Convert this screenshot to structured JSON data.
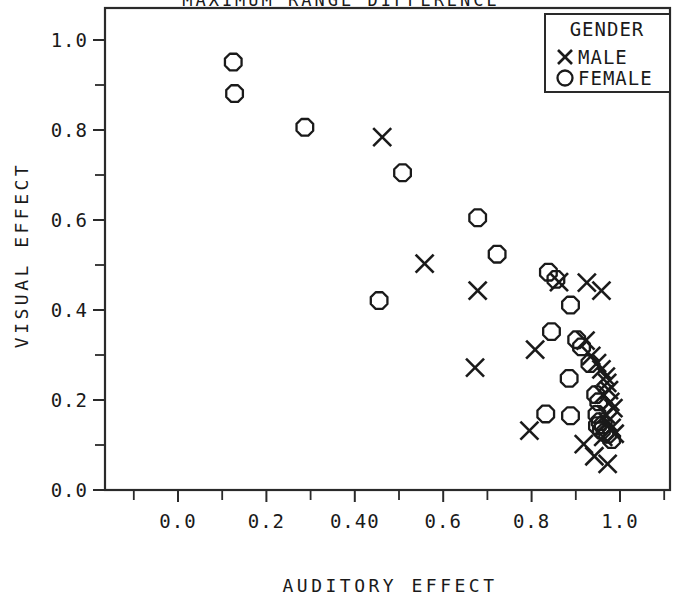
{
  "chart_data": {
    "type": "scatter",
    "title": "MAXIMUM RANGE DIFFERENCE",
    "xlabel": "AUDITORY EFFECT",
    "ylabel": "VISUAL EFFECT",
    "xlim": [
      -0.12,
      1.12
    ],
    "ylim": [
      -0.09,
      1.11
    ],
    "xticks": [
      0.0,
      0.2,
      0.4,
      0.6,
      0.8,
      1.0
    ],
    "xticklabels": [
      "0.0",
      "0.2",
      "0.40",
      "0.6",
      "0.8",
      "1.0"
    ],
    "yticks": [
      0.0,
      0.2,
      0.4,
      0.6,
      0.8,
      1.0
    ],
    "yticklabels": [
      "0.0",
      "0.2",
      "0.4",
      "0.6",
      "0.8",
      "1.0"
    ],
    "minor_ticks": true,
    "grid": false,
    "legend": {
      "title": "GENDER",
      "position": "top-right",
      "entries": [
        {
          "marker": "x",
          "label": "MALE"
        },
        {
          "marker": "o",
          "label": "FEMALE"
        }
      ]
    },
    "series": [
      {
        "name": "FEMALE",
        "marker": "o",
        "points": [
          [
            0.125,
            0.951
          ],
          [
            0.128,
            0.881
          ],
          [
            0.287,
            0.806
          ],
          [
            0.508,
            0.705
          ],
          [
            0.455,
            0.421
          ],
          [
            0.678,
            0.605
          ],
          [
            0.722,
            0.524
          ],
          [
            0.838,
            0.484
          ],
          [
            0.855,
            0.468
          ],
          [
            0.888,
            0.411
          ],
          [
            0.845,
            0.352
          ],
          [
            0.902,
            0.334
          ],
          [
            0.913,
            0.318
          ],
          [
            0.932,
            0.281
          ],
          [
            0.885,
            0.248
          ],
          [
            0.832,
            0.169
          ],
          [
            0.888,
            0.165
          ],
          [
            0.945,
            0.212
          ],
          [
            0.952,
            0.196
          ],
          [
            0.948,
            0.168
          ],
          [
            0.955,
            0.152
          ],
          [
            0.962,
            0.145
          ],
          [
            0.958,
            0.133
          ],
          [
            0.966,
            0.128
          ],
          [
            0.972,
            0.124
          ],
          [
            0.981,
            0.112
          ],
          [
            0.949,
            0.143
          ]
        ]
      },
      {
        "name": "MALE",
        "marker": "x",
        "points": [
          [
            0.462,
            0.784
          ],
          [
            0.558,
            0.503
          ],
          [
            0.678,
            0.443
          ],
          [
            0.672,
            0.272
          ],
          [
            0.808,
            0.312
          ],
          [
            0.862,
            0.462
          ],
          [
            0.925,
            0.461
          ],
          [
            0.958,
            0.443
          ],
          [
            0.922,
            0.332
          ],
          [
            0.935,
            0.298
          ],
          [
            0.948,
            0.282
          ],
          [
            0.958,
            0.268
          ],
          [
            0.968,
            0.252
          ],
          [
            0.971,
            0.238
          ],
          [
            0.975,
            0.222
          ],
          [
            0.962,
            0.212
          ],
          [
            0.978,
            0.196
          ],
          [
            0.985,
            0.182
          ],
          [
            0.968,
            0.168
          ],
          [
            0.972,
            0.152
          ],
          [
            0.981,
            0.138
          ],
          [
            0.988,
            0.125
          ],
          [
            0.962,
            0.118
          ],
          [
            0.918,
            0.102
          ],
          [
            0.942,
            0.075
          ],
          [
            0.972,
            0.058
          ],
          [
            0.795,
            0.132
          ]
        ]
      }
    ]
  }
}
